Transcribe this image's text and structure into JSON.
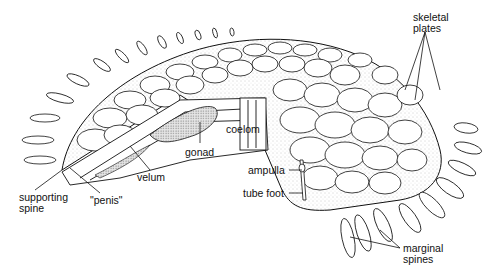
{
  "diagram": {
    "labels": [
      {
        "id": "skeletal-plates",
        "text": "skeletal\nplates",
        "x": 413,
        "y": 12
      },
      {
        "id": "coelom",
        "text": "coelom",
        "x": 226,
        "y": 124
      },
      {
        "id": "gonad",
        "text": "gonad",
        "x": 185,
        "y": 147
      },
      {
        "id": "velum",
        "text": "velum",
        "x": 137,
        "y": 172
      },
      {
        "id": "ampulla",
        "text": "ampulla",
        "x": 248,
        "y": 165
      },
      {
        "id": "tube-foot",
        "text": "tube foot",
        "x": 243,
        "y": 188
      },
      {
        "id": "supporting-spine",
        "text": "supporting\nspine",
        "x": 19,
        "y": 192
      },
      {
        "id": "penis",
        "text": "\"penis\"",
        "x": 90,
        "y": 195
      },
      {
        "id": "marginal-spines",
        "text": "marginal\nspines",
        "x": 403,
        "y": 243
      }
    ],
    "colors": {
      "line": "#111111",
      "fill": "#ffffff",
      "stipple": "#9a9a9a"
    }
  }
}
